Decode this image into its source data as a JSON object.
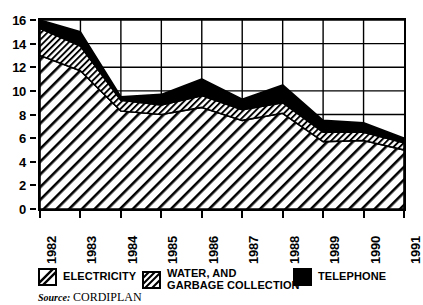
{
  "chart_data": {
    "type": "area",
    "title": "",
    "xlabel": "",
    "ylabel": "",
    "stacked": true,
    "grid": true,
    "ylim": [
      0,
      16
    ],
    "yticks": [
      0,
      2,
      4,
      6,
      8,
      10,
      12,
      14,
      16
    ],
    "categories": [
      "1982",
      "1983",
      "1984",
      "1985",
      "1986",
      "1987",
      "1988",
      "1989",
      "1990",
      "1991"
    ],
    "series": [
      {
        "name": "ELECTRICITY",
        "pattern": "diagonal-hatch-wide",
        "values": [
          13.0,
          11.7,
          8.3,
          8.0,
          8.6,
          7.5,
          8.1,
          5.7,
          5.8,
          5.0
        ]
      },
      {
        "name": "WATER, AND GARBAGE COLLECTION",
        "pattern": "diagonal-hatch-dense",
        "values": [
          2.3,
          2.1,
          0.9,
          0.8,
          1.0,
          0.9,
          0.9,
          0.8,
          0.7,
          0.6
        ]
      },
      {
        "name": "TELEPHONE",
        "pattern": "solid-black",
        "values": [
          0.7,
          1.2,
          0.3,
          0.9,
          1.4,
          0.9,
          1.5,
          1.0,
          0.8,
          0.4
        ]
      }
    ],
    "totals": [
      16.0,
      15.0,
      9.5,
      9.7,
      11.0,
      9.3,
      10.5,
      7.5,
      7.3,
      6.0
    ],
    "legend_position": "bottom"
  },
  "legend": {
    "items": [
      {
        "label": "ELECTRICITY",
        "swatch": "diagonal-hatch-wide"
      },
      {
        "label": "WATER, AND\nGARBAGE COLLECTION",
        "swatch": "diagonal-hatch-dense"
      },
      {
        "label": "TELEPHONE",
        "swatch": "solid-black"
      }
    ]
  },
  "source": {
    "label": "Source:",
    "value": "CORDIPLAN"
  }
}
